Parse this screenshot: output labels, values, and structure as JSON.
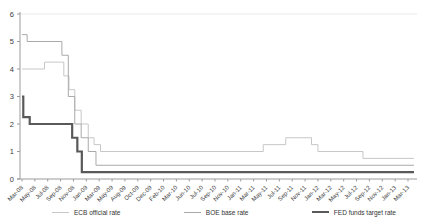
{
  "chart_data": {
    "type": "line",
    "subtype": "step-after",
    "title": "",
    "xlabel": "",
    "ylabel": "",
    "ylim": [
      0,
      6
    ],
    "y_ticks": [
      0,
      1,
      2,
      3,
      4,
      5,
      6
    ],
    "x_tick_labels": [
      "Mar-08",
      "May-08",
      "Jul-08",
      "Sep-08",
      "Nov-08",
      "Jan-09",
      "Mar-09",
      "May-09",
      "Aug-09",
      "Oct-09",
      "Dec-09",
      "Feb-10",
      "Mar-10",
      "Jun-10",
      "Jul-10",
      "Sep-10",
      "Nov-10",
      "Jan-11",
      "Mar-11",
      "May-11",
      "Jul-11",
      "Sep-11",
      "Nov-11",
      "Jan-12",
      "Mar-12",
      "May-12",
      "Jul-12",
      "Sep-12",
      "Nov-12",
      "Jan-13",
      "Mar-13"
    ],
    "x_months_per_tick": 2,
    "x_domain_months": [
      0,
      61
    ],
    "grid": "top-border-only",
    "legend_position": "bottom",
    "colors": {
      "axis": "#9b9b9b",
      "tick_text": "#3d3d3d",
      "top_border": "#e9e9e9"
    },
    "series": [
      {
        "name": "ECB official rate",
        "color": "#c7c7c7",
        "stroke_width": 1,
        "steps": [
          [
            0,
            4.0
          ],
          [
            3.5,
            4.25
          ],
          [
            6.5,
            3.75
          ],
          [
            7.3,
            3.25
          ],
          [
            8.2,
            2.5
          ],
          [
            9.2,
            2.0
          ],
          [
            10.3,
            1.5
          ],
          [
            11.2,
            1.25
          ],
          [
            12.2,
            1.0
          ],
          [
            37.5,
            1.25
          ],
          [
            41,
            1.5
          ],
          [
            45,
            1.25
          ],
          [
            46,
            1.0
          ],
          [
            53,
            0.75
          ]
        ]
      },
      {
        "name": "BOE base rate",
        "color": "#aaaaaa",
        "stroke_width": 1,
        "steps": [
          [
            0,
            5.25
          ],
          [
            0.8,
            5.0
          ],
          [
            6.2,
            4.5
          ],
          [
            7.2,
            3.0
          ],
          [
            8.2,
            2.0
          ],
          [
            9.2,
            1.5
          ],
          [
            10.3,
            1.0
          ],
          [
            11.5,
            0.5
          ]
        ]
      },
      {
        "name": "FED funds target rate",
        "color": "#595959",
        "stroke_width": 2.2,
        "steps": [
          [
            0,
            3.0
          ],
          [
            0.2,
            2.25
          ],
          [
            1.2,
            2.0
          ],
          [
            7.8,
            1.5
          ],
          [
            8.6,
            1.0
          ],
          [
            9.3,
            0.25
          ]
        ]
      }
    ]
  }
}
